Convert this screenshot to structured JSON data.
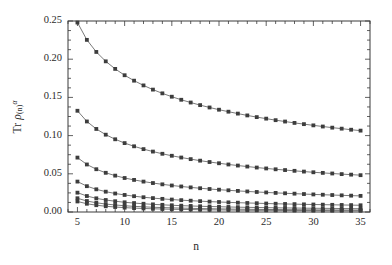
{
  "figure": {
    "background_color": "#ffffff",
    "frame_color": "#3a3a3a",
    "marker_color": "#3d3d3d",
    "line_color": "#6b6b6b"
  },
  "chart_data": {
    "type": "line",
    "title": "",
    "subtitle": "",
    "xlabel": "n",
    "ylabel": "Tr ρ(n)α",
    "ylabel_parts": {
      "prefix": "Tr ",
      "symbol": "ρ",
      "subscript": "(n)",
      "superscript": "α"
    },
    "xlim": [
      4,
      36
    ],
    "ylim": [
      0.0,
      0.25
    ],
    "grid": false,
    "legend": "none",
    "xticks": [
      5,
      10,
      15,
      20,
      25,
      30,
      35
    ],
    "xtick_labels": [
      "5",
      "10",
      "15",
      "20",
      "25",
      "30",
      "35"
    ],
    "xminor_interval": 1,
    "yticks": [
      0.0,
      0.05,
      0.1,
      0.15,
      0.2,
      0.25
    ],
    "ytick_labels": [
      "0.00",
      "0.05",
      "0.10",
      "0.15",
      "0.20",
      "0.25"
    ],
    "yminor_interval": 0.0125,
    "x": [
      5,
      6,
      7,
      8,
      9,
      10,
      11,
      12,
      13,
      14,
      15,
      16,
      17,
      18,
      19,
      20,
      21,
      22,
      23,
      24,
      25,
      26,
      27,
      28,
      29,
      30,
      31,
      32,
      33,
      34,
      35
    ],
    "series": [
      {
        "name": "curve-1",
        "marker": "square",
        "values": [
          0.248,
          0.2253,
          0.2095,
          0.1972,
          0.1873,
          0.179,
          0.1719,
          0.1657,
          0.1602,
          0.1553,
          0.1509,
          0.1469,
          0.1433,
          0.1399,
          0.1368,
          0.1339,
          0.1313,
          0.1288,
          0.1264,
          0.1242,
          0.1222,
          0.1202,
          0.1184,
          0.1166,
          0.115,
          0.1134,
          0.1119,
          0.1104,
          0.1091,
          0.1077,
          0.1065
        ]
      },
      {
        "name": "curve-2",
        "marker": "square",
        "values": [
          0.1325,
          0.1185,
          0.1087,
          0.1012,
          0.0952,
          0.0902,
          0.086,
          0.0823,
          0.0791,
          0.0762,
          0.0736,
          0.0713,
          0.0692,
          0.0672,
          0.0654,
          0.0638,
          0.0622,
          0.0608,
          0.0595,
          0.0582,
          0.057,
          0.0559,
          0.0549,
          0.0539,
          0.0529,
          0.052,
          0.0512,
          0.0504,
          0.0496,
          0.0489,
          0.0482
        ]
      },
      {
        "name": "curve-3",
        "marker": "square",
        "values": [
          0.0712,
          0.0622,
          0.056,
          0.0513,
          0.0476,
          0.0445,
          0.042,
          0.0398,
          0.0379,
          0.0362,
          0.0347,
          0.0334,
          0.0322,
          0.0311,
          0.0301,
          0.0292,
          0.0284,
          0.0276,
          0.0269,
          0.0262,
          0.0256,
          0.025,
          0.0245,
          0.024,
          0.0235,
          0.023,
          0.0226,
          0.0222,
          0.0218,
          0.0214,
          0.0211
        ]
      },
      {
        "name": "curve-4",
        "marker": "square",
        "values": [
          0.0398,
          0.0338,
          0.0297,
          0.0266,
          0.0242,
          0.0223,
          0.0207,
          0.0193,
          0.0182,
          0.0172,
          0.0163,
          0.0155,
          0.0148,
          0.0142,
          0.0136,
          0.0131,
          0.0126,
          0.0122,
          0.0118,
          0.0115,
          0.0111,
          0.0108,
          0.0105,
          0.0103,
          0.01,
          0.0098,
          0.0096,
          0.0094,
          0.0092,
          0.009,
          0.0088
        ]
      },
      {
        "name": "curve-5",
        "marker": "square",
        "values": [
          0.0253,
          0.0209,
          0.0179,
          0.0157,
          0.0141,
          0.0127,
          0.0117,
          0.0108,
          0.01,
          0.0094,
          0.0088,
          0.0083,
          0.0079,
          0.0075,
          0.0072,
          0.0069,
          0.0066,
          0.0063,
          0.0061,
          0.0059,
          0.0057,
          0.0055,
          0.0053,
          0.0052,
          0.005,
          0.0049,
          0.0048,
          0.0047,
          0.0045,
          0.0044,
          0.0043
        ]
      },
      {
        "name": "curve-6",
        "marker": "square",
        "values": [
          0.018,
          0.0144,
          0.0121,
          0.0104,
          0.0092,
          0.0082,
          0.0074,
          0.0068,
          0.0062,
          0.0058,
          0.0054,
          0.0051,
          0.0048,
          0.0045,
          0.0043,
          0.0041,
          0.0039,
          0.0037,
          0.0036,
          0.0034,
          0.0033,
          0.0032,
          0.0031,
          0.003,
          0.0029,
          0.0028,
          0.0027,
          0.0027,
          0.0026,
          0.0025,
          0.0025
        ]
      },
      {
        "name": "curve-7",
        "marker": "square",
        "values": [
          0.0138,
          0.0108,
          0.0089,
          0.0075,
          0.0065,
          0.0057,
          0.0051,
          0.0046,
          0.0042,
          0.0039,
          0.0036,
          0.0034,
          0.0032,
          0.003,
          0.0028,
          0.0027,
          0.0026,
          0.0024,
          0.0023,
          0.0022,
          0.0022,
          0.0021,
          0.002,
          0.0019,
          0.0019,
          0.0018,
          0.0018,
          0.0017,
          0.0017,
          0.0016,
          0.0016
        ]
      }
    ]
  }
}
